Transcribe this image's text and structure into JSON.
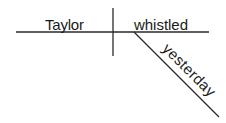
{
  "diagram": {
    "type": "sentence-diagram",
    "subject": "Taylor",
    "verb": "whistled",
    "modifier": "yesterday",
    "colors": {
      "line": "#2a2a2a",
      "text": "#1a1a1a",
      "background": "#ffffff"
    }
  }
}
